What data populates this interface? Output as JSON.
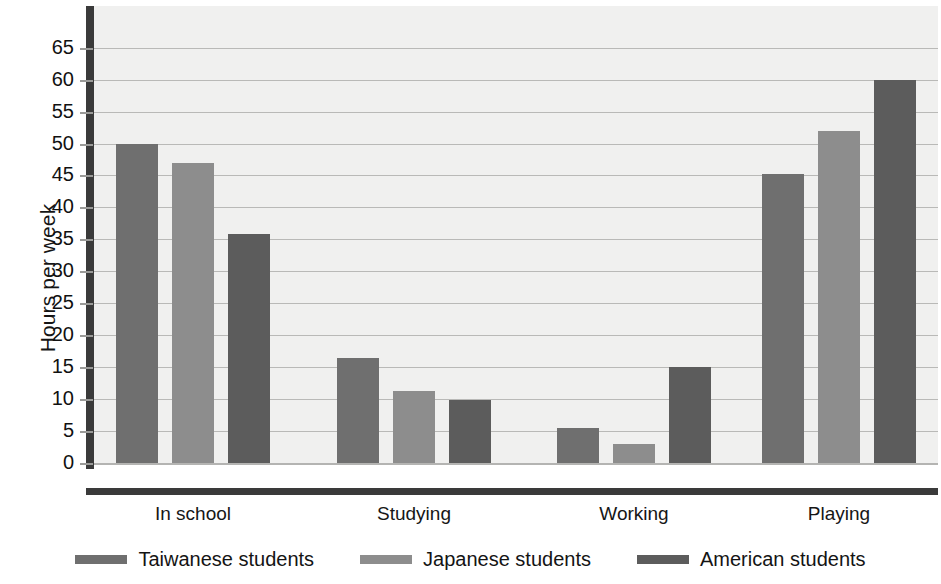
{
  "chart_data": {
    "type": "bar",
    "title": "",
    "xlabel": "",
    "ylabel": "Hours per week",
    "categories": [
      "In school",
      "Studying",
      "Working",
      "Playing"
    ],
    "series": [
      {
        "name": "Taiwanese students",
        "color": "#6f6f6f",
        "values": [
          50,
          16.5,
          5.5,
          45.3
        ]
      },
      {
        "name": "Japanese students",
        "color": "#8d8d8d",
        "values": [
          47,
          11.3,
          3.0,
          52.0
        ]
      },
      {
        "name": "American students",
        "color": "#5c5c5c",
        "values": [
          35.8,
          9.8,
          15.0,
          60.0
        ]
      }
    ],
    "ylim": [
      0,
      68
    ],
    "yticks": [
      0,
      5,
      10,
      15,
      20,
      25,
      30,
      35,
      40,
      45,
      50,
      55,
      60,
      65
    ],
    "ytick_labels": [
      "0",
      "5",
      "10",
      "15",
      "20",
      "25",
      "30",
      "35",
      "40",
      "45",
      "50",
      "55",
      "60",
      "65"
    ],
    "grid": true,
    "legend_position": "bottom",
    "plot_background": "#f0f0ef",
    "gridline_color": "#b9b9b7",
    "axis_color": "#3a3a3a"
  },
  "legend": {
    "items": [
      {
        "label": "Taiwanese students"
      },
      {
        "label": "Japanese students"
      },
      {
        "label": "American students"
      }
    ]
  }
}
